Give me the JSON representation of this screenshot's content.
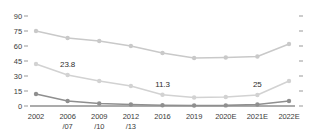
{
  "chart_data": {
    "type": "line",
    "title": "",
    "xlabel": "",
    "ylabel": "",
    "ylim": [
      0,
      90
    ],
    "yticks": [
      0,
      15,
      30,
      45,
      60,
      75,
      90
    ],
    "grid": false,
    "legend": "none",
    "categories": [
      "2002",
      "2006/07",
      "2009/10",
      "2012/13",
      "2016",
      "2019",
      "2020E",
      "2021E",
      "2022E"
    ],
    "category_lines": [
      [
        "2002",
        ""
      ],
      [
        "2006",
        "/07"
      ],
      [
        "2009",
        "/10"
      ],
      [
        "2012",
        "/13"
      ],
      [
        "2016",
        ""
      ],
      [
        "2019",
        ""
      ],
      [
        "2020E",
        ""
      ],
      [
        "2021E",
        ""
      ],
      [
        "2022E",
        ""
      ]
    ],
    "series": [
      {
        "name": "series-1",
        "color": "#c9c9c9",
        "values": [
          75.0,
          68.0,
          65.0,
          60.0,
          53.0,
          48.0,
          48.5,
          49.5,
          62.0
        ]
      },
      {
        "name": "series-2",
        "color": "#d2d2d2",
        "values": [
          42.0,
          31.0,
          25.0,
          20.0,
          11.3,
          8.5,
          9.0,
          11.0,
          25.0
        ]
      },
      {
        "name": "series-3",
        "color": "#8f8f8f",
        "values": [
          12.0,
          5.0,
          2.5,
          1.5,
          0.8,
          0.5,
          0.6,
          1.5,
          5.0
        ]
      }
    ],
    "annotations": [
      {
        "text": "23.8",
        "category": "2006/07",
        "value": 42.0
      },
      {
        "text": "11.3",
        "category": "2016",
        "value": 22.0
      },
      {
        "text": "25",
        "category": "2021E",
        "value": 22.0
      }
    ],
    "axis_line_color": "#8f8f8f",
    "tick_color": "#9a9a9a",
    "text_color": "#3b3b3b"
  }
}
